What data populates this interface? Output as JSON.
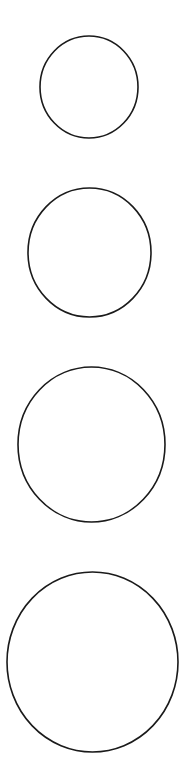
{
  "canvas": {
    "width": 187,
    "height": 783,
    "background": "#ffffff"
  },
  "stroke": {
    "color": "#1a1a1a",
    "width": 1.6
  },
  "circles": [
    {
      "name": "circle-small",
      "cx": 89,
      "cy": 87,
      "rx": 49,
      "ry": 51
    },
    {
      "name": "circle-medium",
      "cx": 89.5,
      "cy": 252.5,
      "rx": 61.5,
      "ry": 64.5
    },
    {
      "name": "circle-large",
      "cx": 91.5,
      "cy": 444.5,
      "rx": 73.5,
      "ry": 77.5
    },
    {
      "name": "circle-xlarge",
      "cx": 92.5,
      "cy": 662,
      "rx": 85.5,
      "ry": 90
    }
  ]
}
